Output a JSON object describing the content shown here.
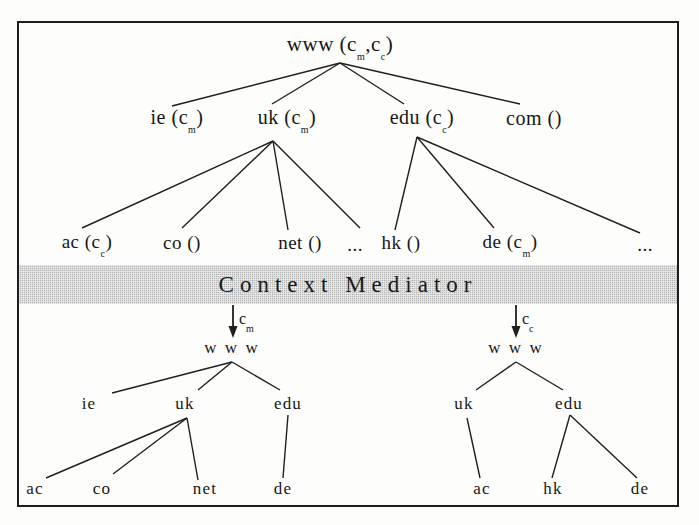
{
  "figure": {
    "band_label": "Context Mediator",
    "frame_color": "#1d1d1d",
    "band_color": "#b3b3b3",
    "ink_color": "#161616"
  },
  "top_tree": {
    "root": {
      "name": "www",
      "context": "( c_m , c_c )",
      "base": "www",
      "open": "(",
      "ctx1": "c",
      "sub1": "m",
      "comma": ",",
      "ctx2": "c",
      "sub2": "c",
      "close": ")"
    },
    "level1": [
      {
        "base": "ie",
        "open": "(",
        "ctx": "c",
        "sub": "m",
        "close": ")"
      },
      {
        "base": "uk",
        "open": "(",
        "ctx": "c",
        "sub": "m",
        "close": ")"
      },
      {
        "base": "edu",
        "open": "(",
        "ctx": "c",
        "sub": "c",
        "close": ")"
      },
      {
        "base": "com",
        "open": "(",
        "ctx": "",
        "sub": "",
        "close": ")"
      }
    ],
    "level2": [
      {
        "base": "ac",
        "open": "(",
        "ctx": "c",
        "sub": "c",
        "close": ")"
      },
      {
        "base": "co",
        "open": "(",
        "ctx": "",
        "sub": "",
        "close": ")"
      },
      {
        "base": "net",
        "open": "(",
        "ctx": "",
        "sub": "",
        "close": ")"
      },
      {
        "base": "hk",
        "open": "(",
        "ctx": "",
        "sub": "",
        "close": ")"
      },
      {
        "base": "de",
        "open": "(",
        "ctx": "c",
        "sub": "m",
        "close": ")"
      }
    ],
    "ellipsis_after_net": "...",
    "ellipsis_after_de": "..."
  },
  "left_tree": {
    "arrow_ctx": "c",
    "arrow_sub": "m",
    "root": "w w w",
    "level1": [
      "ie",
      "uk",
      "edu"
    ],
    "level2": [
      "ac",
      "co",
      "net",
      "de"
    ]
  },
  "right_tree": {
    "arrow_ctx": "c",
    "arrow_sub": "c",
    "root": "w w w",
    "level1": [
      "uk",
      "edu"
    ],
    "level2": [
      "ac",
      "hk",
      "de"
    ]
  }
}
